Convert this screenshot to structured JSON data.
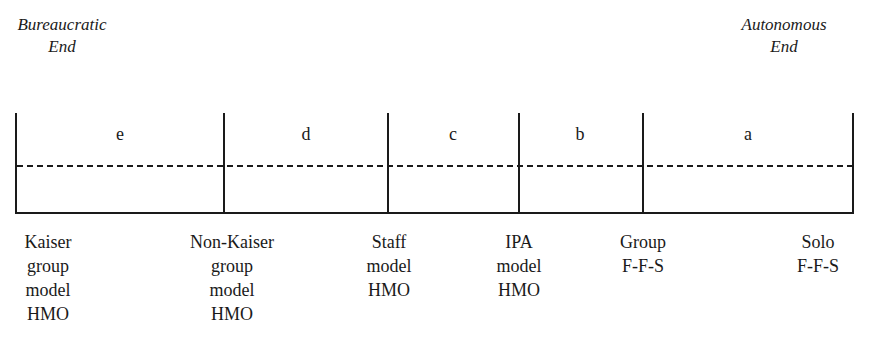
{
  "ends": {
    "left": {
      "line1": "Bureaucratic",
      "line2": "End"
    },
    "right": {
      "line1": "Autonomous",
      "line2": "End"
    }
  },
  "segments": [
    {
      "letter": "e"
    },
    {
      "letter": "d"
    },
    {
      "letter": "c"
    },
    {
      "letter": "b"
    },
    {
      "letter": "a"
    }
  ],
  "categories": [
    {
      "lines": [
        "Kaiser",
        "group",
        "model",
        "HMO"
      ]
    },
    {
      "lines": [
        "Non-Kaiser",
        "group",
        "model",
        "HMO"
      ]
    },
    {
      "lines": [
        "Staff",
        "model",
        "HMO"
      ]
    },
    {
      "lines": [
        "IPA",
        "model",
        "HMO"
      ]
    },
    {
      "lines": [
        "Group",
        "F-F-S"
      ]
    },
    {
      "lines": [
        "Solo",
        "F-F-S"
      ]
    }
  ]
}
